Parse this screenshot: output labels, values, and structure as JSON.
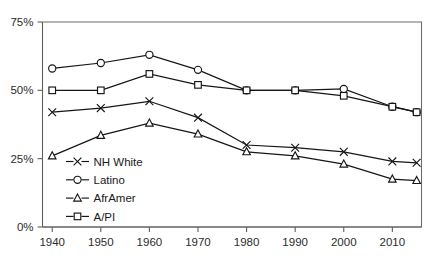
{
  "chart_data": {
    "type": "line",
    "title": "",
    "subtitle": "",
    "xlabel": "",
    "ylabel": "",
    "grid": false,
    "legend_position": "inside-bottom-left",
    "x": [
      1940,
      1950,
      1960,
      1970,
      1980,
      1990,
      2000,
      2010,
      2015
    ],
    "xlim": [
      1938,
      2016
    ],
    "ylim": [
      0,
      75
    ],
    "yticks": [
      0,
      25,
      50,
      75
    ],
    "ytick_labels": [
      "0%",
      "25%",
      "50%",
      "75%"
    ],
    "xticks": [
      1940,
      1950,
      1960,
      1970,
      1980,
      1990,
      2000,
      2010
    ],
    "xtick_labels": [
      "1940",
      "1950",
      "1960",
      "1970",
      "1980",
      "1990",
      "2000",
      "2010"
    ],
    "series": [
      {
        "name": "NH White",
        "marker": "x",
        "values": [
          42.0,
          43.5,
          46.0,
          40.0,
          30.0,
          29.0,
          27.5,
          24.0,
          23.5
        ]
      },
      {
        "name": "Latino",
        "marker": "circle",
        "values": [
          58.0,
          60.0,
          63.0,
          57.5,
          50.0,
          50.0,
          50.5,
          44.0,
          42.0
        ]
      },
      {
        "name": "AfrAmer",
        "marker": "triangle",
        "values": [
          26.0,
          33.5,
          38.0,
          34.0,
          27.5,
          26.0,
          23.0,
          17.5,
          17.0
        ]
      },
      {
        "name": "A/PI",
        "marker": "square",
        "values": [
          50.0,
          50.0,
          56.0,
          52.0,
          50.0,
          50.0,
          48.0,
          44.0,
          42.0
        ]
      }
    ]
  },
  "legend": {
    "entries": [
      {
        "label": "NH White",
        "marker": "x"
      },
      {
        "label": "Latino",
        "marker": "circle"
      },
      {
        "label": "AfrAmer",
        "marker": "triangle"
      },
      {
        "label": "A/PI",
        "marker": "square"
      }
    ]
  }
}
